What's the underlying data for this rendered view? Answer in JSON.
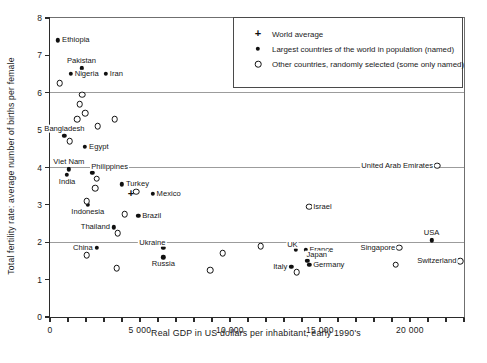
{
  "colors": {
    "background": "#ffffff",
    "axis": "#2b2b2b",
    "grid": "#9c9c9c",
    "marker": "#101010"
  },
  "legend": {
    "items": [
      {
        "symbol": "plus",
        "label": "World average"
      },
      {
        "symbol": "filled-circle",
        "label": "Largest countries of the world in population (named)"
      },
      {
        "symbol": "open-circle",
        "label": "Other countries, randomly selected (some only named)"
      }
    ]
  },
  "chart_data": {
    "type": "scatter",
    "title": "",
    "xlabel": "Real GDP in US dollars per inhabitant, early 1990's",
    "ylabel": "Total fertility rate: average number of births per female",
    "xlim": [
      0,
      23000
    ],
    "ylim": [
      0,
      8
    ],
    "x_major_ticks": [
      0,
      5000,
      10000,
      15000,
      20000
    ],
    "x_major_tick_labels": [
      "0",
      "5 000",
      "10 000",
      "15 000",
      "20 000"
    ],
    "x_minor_tick_step": 1000,
    "y_ticks": [
      0,
      1,
      2,
      3,
      4,
      5,
      6,
      7,
      8
    ],
    "gridlines_y": [
      2,
      4,
      6
    ],
    "grid": "horizontal-only",
    "legend_position": "top-right-inside",
    "series": [
      {
        "name": "World average",
        "marker": "plus",
        "points": [
          {
            "x": 4500,
            "y": 3.3
          }
        ]
      },
      {
        "name": "Largest countries of the world in population (named)",
        "marker": "filled-circle",
        "points": [
          {
            "x": 450,
            "y": 7.4,
            "label": "Ethiopia",
            "label_pos": "right"
          },
          {
            "x": 1750,
            "y": 6.65,
            "label": "Pakistan",
            "label_pos": "above"
          },
          {
            "x": 1150,
            "y": 6.5,
            "label": "Nigeria",
            "label_pos": "right"
          },
          {
            "x": 3100,
            "y": 6.5,
            "label": "Iran",
            "label_pos": "right"
          },
          {
            "x": 800,
            "y": 4.85,
            "label": "Bangladesh",
            "label_pos": "above"
          },
          {
            "x": 1950,
            "y": 4.55,
            "label": "Egypt",
            "label_pos": "right"
          },
          {
            "x": 1050,
            "y": 3.95,
            "label": "Viet Nam",
            "label_pos": "above"
          },
          {
            "x": 950,
            "y": 3.8,
            "label": "India",
            "label_pos": "below"
          },
          {
            "x": 2350,
            "y": 3.85,
            "label": "Philippines",
            "label_pos": "above-right"
          },
          {
            "x": 4000,
            "y": 3.55,
            "label": "Turkey",
            "label_pos": "right"
          },
          {
            "x": 5700,
            "y": 3.3,
            "label": "Mexico",
            "label_pos": "right"
          },
          {
            "x": 2100,
            "y": 3.0,
            "label": "Indonesia",
            "label_pos": "below"
          },
          {
            "x": 4900,
            "y": 2.7,
            "label": "Brazil",
            "label_pos": "right"
          },
          {
            "x": 3550,
            "y": 2.4,
            "label": "Thailand",
            "label_pos": "left"
          },
          {
            "x": 2600,
            "y": 1.85,
            "label": "China",
            "label_pos": "left"
          },
          {
            "x": 6300,
            "y": 1.85,
            "label": "Ukraine",
            "label_pos": "above-left"
          },
          {
            "x": 6300,
            "y": 1.6,
            "label": "Russia",
            "label_pos": "below"
          },
          {
            "x": 13650,
            "y": 1.8,
            "label": "UK",
            "label_pos": "above-left"
          },
          {
            "x": 14200,
            "y": 1.8,
            "label": "France",
            "label_pos": "right"
          },
          {
            "x": 14300,
            "y": 1.5,
            "label": "Japan",
            "label_pos": "above-right"
          },
          {
            "x": 14400,
            "y": 1.4,
            "label": "Germany",
            "label_pos": "right"
          },
          {
            "x": 13400,
            "y": 1.35,
            "label": "Italy",
            "label_pos": "left"
          },
          {
            "x": 21200,
            "y": 2.05,
            "label": "USA",
            "label_pos": "above"
          }
        ]
      },
      {
        "name": "Other countries, randomly selected (some only named)",
        "marker": "open-circle",
        "points": [
          {
            "x": 21500,
            "y": 4.05,
            "label": "United Arab Emirates",
            "label_pos": "left"
          },
          {
            "x": 14400,
            "y": 2.95,
            "label": "Israel",
            "label_pos": "right"
          },
          {
            "x": 19400,
            "y": 1.85,
            "label": "Singapore",
            "label_pos": "left"
          },
          {
            "x": 22800,
            "y": 1.5,
            "label": "Switzerland",
            "label_pos": "left"
          },
          {
            "x": 550,
            "y": 6.25
          },
          {
            "x": 1800,
            "y": 5.95
          },
          {
            "x": 1650,
            "y": 5.7
          },
          {
            "x": 1950,
            "y": 5.45
          },
          {
            "x": 1500,
            "y": 5.3
          },
          {
            "x": 3600,
            "y": 5.3
          },
          {
            "x": 2650,
            "y": 5.1
          },
          {
            "x": 1100,
            "y": 4.7
          },
          {
            "x": 2600,
            "y": 3.7
          },
          {
            "x": 2500,
            "y": 3.45
          },
          {
            "x": 4800,
            "y": 3.35
          },
          {
            "x": 2050,
            "y": 3.1
          },
          {
            "x": 4150,
            "y": 2.75
          },
          {
            "x": 3750,
            "y": 2.25
          },
          {
            "x": 2050,
            "y": 1.65
          },
          {
            "x": 9600,
            "y": 1.7
          },
          {
            "x": 11700,
            "y": 1.9
          },
          {
            "x": 3700,
            "y": 1.3
          },
          {
            "x": 8900,
            "y": 1.25
          },
          {
            "x": 13700,
            "y": 1.2
          },
          {
            "x": 19200,
            "y": 1.4
          }
        ]
      }
    ]
  }
}
